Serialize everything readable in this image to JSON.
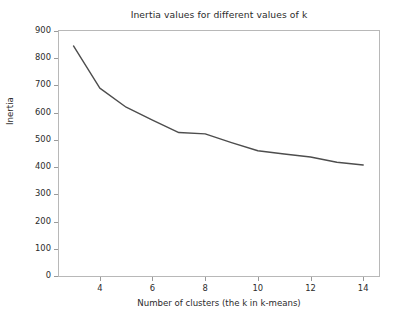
{
  "chart_data": {
    "type": "line",
    "title": "Inertia values for different values of k",
    "xlabel": "Number of clusters (the k in k-means)",
    "ylabel": "Inertia",
    "x": [
      3,
      4,
      5,
      6,
      7,
      8,
      9,
      10,
      11,
      12,
      13,
      14
    ],
    "values": [
      845,
      690,
      620,
      573,
      527,
      522,
      490,
      460,
      448,
      437,
      418,
      408
    ],
    "series": [
      {
        "name": "Inertia",
        "values": [
          845,
          690,
          620,
          573,
          527,
          522,
          490,
          460,
          448,
          437,
          418,
          408
        ]
      }
    ],
    "xlim": [
      2.45,
      14.6
    ],
    "ylim": [
      0,
      900
    ],
    "xticks": [
      4,
      6,
      8,
      10,
      12,
      14
    ],
    "yticks": [
      0,
      100,
      200,
      300,
      400,
      500,
      600,
      700,
      800,
      900
    ],
    "xtick_labels": [
      "4",
      "6",
      "8",
      "10",
      "12",
      "14"
    ],
    "ytick_labels": [
      "0",
      "100",
      "200",
      "300",
      "400",
      "500",
      "600",
      "700",
      "800",
      "900"
    ],
    "grid": false,
    "legend": false,
    "legend_position": "none",
    "line_color": "#4d4d4d",
    "line_width": 1.4,
    "marker": "none",
    "background_color": "#ffffff",
    "frame_color": "#b8b8b8",
    "tick_color": "#9a9a9a",
    "text_color": "#2b2b2b"
  }
}
